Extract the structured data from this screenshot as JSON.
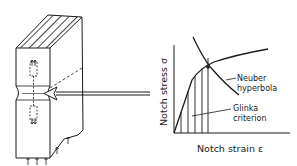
{
  "diagram": {
    "specimen": {
      "description": "Notched specimen block with hatched cross-section and cyclic load arrows"
    },
    "chart": {
      "y_axis_label": "Notch stress σ",
      "x_axis_label": "Notch strain ε",
      "annotations": [
        {
          "label_line1": "Neuber",
          "label_line2": "hyperbola"
        },
        {
          "label_line1": "Glinka",
          "label_line2": "criterion"
        }
      ]
    },
    "colors": {
      "ink": "#1a1a1a",
      "background": "#ffffff"
    }
  }
}
